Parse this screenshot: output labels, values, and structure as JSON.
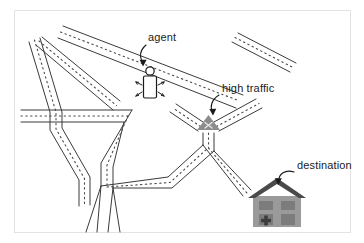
{
  "figure": {
    "kind": "street-map-diagram",
    "background_color": "#ffffff",
    "border_color": "#e3e3e3"
  },
  "annotations": [
    {
      "id": "agent",
      "label": "agent",
      "label_x": 148,
      "label_y": 41,
      "arrow_from_x": 146,
      "arrow_from_y": 45,
      "arrow_to_x": 143,
      "arrow_to_y": 64
    },
    {
      "id": "high-traffic",
      "label": "high traffic",
      "label_x": 222,
      "label_y": 92,
      "arrow_from_x": 219,
      "arrow_from_y": 95,
      "arrow_to_x": 213,
      "arrow_to_y": 113
    },
    {
      "id": "destination",
      "label": "destination",
      "label_x": 297,
      "label_y": 169,
      "arrow_from_x": 294,
      "arrow_from_y": 172,
      "arrow_to_x": 279,
      "arrow_to_y": 185
    }
  ],
  "markers": {
    "agent": {
      "name": "agent",
      "x": 150,
      "y": 86,
      "head_radius": 4.2,
      "body_width": 13,
      "body_height": 22,
      "fill_color": "#ffffff",
      "stroke_color": "#1b1b1b"
    },
    "high_traffic": {
      "name": "high traffic",
      "x": 212,
      "y": 125,
      "size": 20,
      "fill_color": "#8c8c8c",
      "symbol": "x",
      "symbol_color": "#e8e8e8"
    },
    "destination": {
      "name": "destination",
      "x": 277,
      "y": 207,
      "roof_color": "#4a4a4a",
      "wall_color": "#9a9a9a",
      "window_color": "#7c7c7c",
      "door_symbol": "plus",
      "width": 52,
      "height": 50
    }
  },
  "colors": {
    "road_edge": "#3a3a3a",
    "road_center_dash": "#4a4a4a",
    "text": "#1b1b1b",
    "traffic_marker": "#8c8c8c",
    "house_roof": "#4a4a4a",
    "house_wall": "#9a9a9a"
  },
  "roads": {
    "count": 9,
    "style": "double-line-with-dashed-centerline",
    "description": "Irregular street network of intersecting roads drawn as paired outlines with dotted center dividers."
  }
}
